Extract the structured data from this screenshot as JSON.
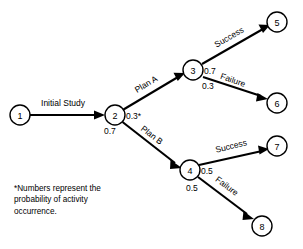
{
  "diagram": {
    "type": "decision-tree",
    "nodes": [
      {
        "id": "1",
        "label": "1",
        "cx": 20,
        "cy": 115,
        "r": 10
      },
      {
        "id": "2",
        "label": "2",
        "cx": 115,
        "cy": 115,
        "r": 10
      },
      {
        "id": "3",
        "label": "3",
        "cx": 193,
        "cy": 70,
        "r": 10
      },
      {
        "id": "4",
        "label": "4",
        "cx": 190,
        "cy": 170,
        "r": 10
      },
      {
        "id": "5",
        "label": "5",
        "cx": 277,
        "cy": 22,
        "r": 10
      },
      {
        "id": "6",
        "label": "6",
        "cx": 277,
        "cy": 103,
        "r": 10
      },
      {
        "id": "7",
        "label": "7",
        "cx": 277,
        "cy": 146,
        "r": 10
      },
      {
        "id": "8",
        "label": "8",
        "cx": 262,
        "cy": 226,
        "r": 10
      }
    ],
    "edges": [
      {
        "id": "e1",
        "from": "1",
        "to": "2",
        "label": "Initial Study",
        "probability": ""
      },
      {
        "id": "e2",
        "from": "2",
        "to": "3",
        "label": "Plan A",
        "probability": "0.3*"
      },
      {
        "id": "e3",
        "from": "2",
        "to": "4",
        "label": "Plan B",
        "probability": "0.7"
      },
      {
        "id": "e4",
        "from": "3",
        "to": "5",
        "label": "Success",
        "probability": "0.7"
      },
      {
        "id": "e5",
        "from": "3",
        "to": "6",
        "label": "Failure",
        "probability": "0.3"
      },
      {
        "id": "e6",
        "from": "4",
        "to": "7",
        "label": "Success",
        "probability": "0.5"
      },
      {
        "id": "e7",
        "from": "4",
        "to": "8",
        "label": "Failure",
        "probability": "0.5"
      }
    ],
    "edge_labels": {
      "initial_study": "Initial Study",
      "plan_a": "Plan A",
      "plan_b": "Plan B",
      "success_top": "Success",
      "failure_top": "Failure",
      "success_bottom": "Success",
      "failure_bottom": "Failure"
    },
    "probabilities": {
      "plan_a": "0.3*",
      "plan_b": "0.7",
      "success_top": "0.7",
      "failure_top": "0.3",
      "success_bottom": "0.5",
      "failure_bottom": "0.5"
    },
    "node_labels": {
      "n1": "1",
      "n2": "2",
      "n3": "3",
      "n4": "4",
      "n5": "5",
      "n6": "6",
      "n7": "7",
      "n8": "8"
    },
    "footnote": {
      "marker": "*",
      "text": "Numbers represent the\nprobability of activity\noccurrence."
    },
    "colors": {
      "line": "#000000",
      "background": "#ffffff",
      "text": "#000000"
    }
  }
}
